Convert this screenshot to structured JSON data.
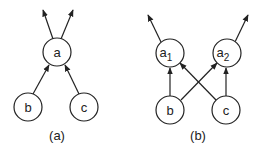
{
  "diagrams": [
    {
      "caption": "(a)",
      "nodes": [
        {
          "id": "a",
          "label": "a",
          "sub": ""
        },
        {
          "id": "b",
          "label": "b",
          "sub": ""
        },
        {
          "id": "c",
          "label": "c",
          "sub": ""
        }
      ],
      "edges": [
        {
          "from": "b",
          "to": "a"
        },
        {
          "from": "c",
          "to": "a"
        },
        {
          "from": "a",
          "to": "out-left"
        },
        {
          "from": "a",
          "to": "out-right"
        }
      ]
    },
    {
      "caption": "(b)",
      "nodes": [
        {
          "id": "a1",
          "label": "a",
          "sub": "1"
        },
        {
          "id": "a2",
          "label": "a",
          "sub": "2"
        },
        {
          "id": "b",
          "label": "b",
          "sub": ""
        },
        {
          "id": "c",
          "label": "c",
          "sub": ""
        }
      ],
      "edges": [
        {
          "from": "b",
          "to": "a1"
        },
        {
          "from": "b",
          "to": "a2"
        },
        {
          "from": "c",
          "to": "a1"
        },
        {
          "from": "c",
          "to": "a2"
        },
        {
          "from": "a1",
          "to": "out-left"
        },
        {
          "from": "a2",
          "to": "out-right"
        }
      ]
    }
  ]
}
